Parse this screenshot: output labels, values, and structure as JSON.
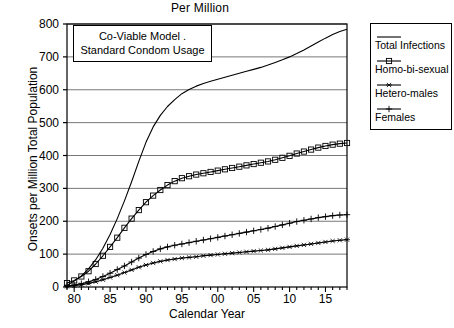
{
  "chart_data": {
    "type": "line",
    "title": "Per Million",
    "xlabel": "Calendar Year",
    "ylabel": "Onsets per Million Total Population",
    "xlim": [
      79,
      118
    ],
    "ylim": [
      0,
      800
    ],
    "xticks": [
      80,
      85,
      90,
      95,
      100,
      105,
      110,
      115
    ],
    "xtick_labels": [
      "80",
      "85",
      "90",
      "95",
      "00",
      "05",
      "10",
      "15"
    ],
    "yticks": [
      0,
      100,
      200,
      300,
      400,
      500,
      600,
      700,
      800
    ],
    "ytick_labels": [
      "0",
      "100",
      "200",
      "300",
      "400",
      "500",
      "600",
      "700",
      "800"
    ],
    "grid": "horizontal",
    "legend_position": "right-outside",
    "annotation": {
      "line1": "Co-Viable  Model .",
      "line2": "Standard Condom Usage"
    },
    "x": [
      79,
      80,
      81,
      82,
      83,
      84,
      85,
      86,
      87,
      88,
      89,
      90,
      91,
      92,
      93,
      94,
      95,
      96,
      97,
      98,
      99,
      100,
      101,
      102,
      103,
      104,
      105,
      106,
      107,
      108,
      109,
      110,
      111,
      112,
      113,
      114,
      115,
      116,
      117,
      118
    ],
    "series": [
      {
        "name": "Total Infections",
        "marker": "none",
        "color": "#000000",
        "values": [
          5,
          18,
          34,
          55,
          83,
          118,
          160,
          208,
          262,
          320,
          382,
          440,
          487,
          522,
          549,
          570,
          588,
          601,
          611,
          619,
          626,
          632,
          638,
          644,
          650,
          656,
          662,
          668,
          675,
          683,
          691,
          700,
          710,
          721,
          733,
          745,
          757,
          768,
          777,
          784
        ]
      },
      {
        "name": "Homo-bi-sexual",
        "marker": "square",
        "color": "#000000",
        "values": [
          12,
          20,
          32,
          48,
          70,
          95,
          122,
          150,
          180,
          208,
          234,
          258,
          278,
          295,
          310,
          322,
          331,
          337,
          342,
          346,
          350,
          354,
          358,
          362,
          366,
          370,
          374,
          378,
          382,
          387,
          393,
          399,
          406,
          412,
          418,
          424,
          429,
          433,
          436,
          438
        ]
      },
      {
        "name": "Hetero-males",
        "marker": "asterisk",
        "color": "#000000",
        "values": [
          2,
          4,
          7,
          11,
          16,
          22,
          29,
          36,
          44,
          52,
          60,
          67,
          73,
          78,
          82,
          85,
          88,
          90,
          92,
          95,
          97,
          99,
          101,
          103,
          105,
          107,
          109,
          111,
          113,
          116,
          119,
          122,
          125,
          128,
          131,
          134,
          137,
          140,
          142,
          144
        ]
      },
      {
        "name": "Females",
        "marker": "plus",
        "color": "#000000",
        "values": [
          3,
          6,
          10,
          16,
          23,
          32,
          42,
          53,
          64,
          76,
          88,
          99,
          108,
          116,
          122,
          127,
          131,
          135,
          139,
          143,
          147,
          151,
          155,
          159,
          163,
          167,
          171,
          175,
          179,
          184,
          189,
          194,
          199,
          203,
          207,
          211,
          214,
          217,
          219,
          220
        ]
      }
    ]
  }
}
